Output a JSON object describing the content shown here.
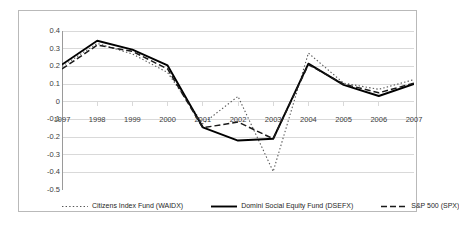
{
  "chart_data": {
    "type": "line",
    "title": "",
    "xlabel": "",
    "ylabel": "",
    "categories": [
      "1997",
      "1998",
      "1999",
      "2000",
      "2001",
      "2002",
      "2003",
      "2004",
      "2005",
      "2006",
      "2007"
    ],
    "ylim": [
      -0.5,
      0.4
    ],
    "ytick_labels": [
      "0.4",
      "0.3",
      "0.2",
      "0.1",
      "0",
      "-0.1",
      "-0.2",
      "-0.3",
      "-0.4",
      "-0.5"
    ],
    "ytick_values": [
      0.4,
      0.3,
      0.2,
      0.1,
      0,
      -0.1,
      -0.2,
      -0.3,
      -0.4,
      -0.5
    ],
    "grid": true,
    "legend_position": "bottom",
    "series": [
      {
        "name": "Citizens Index Fund (WAIDX)",
        "style": "dotted",
        "color": "#555555",
        "values": [
          0.2,
          0.33,
          0.27,
          0.165,
          -0.125,
          0.03,
          -0.395,
          0.275,
          0.105,
          0.07,
          0.125
        ]
      },
      {
        "name": "Domini Social Equity Fund (DSEFX)",
        "style": "solid",
        "color": "#000000",
        "values": [
          0.21,
          0.345,
          0.295,
          0.205,
          -0.145,
          -0.22,
          -0.21,
          0.215,
          0.095,
          0.032,
          0.1
        ]
      },
      {
        "name": "S&P 500 (SPX)",
        "style": "dashed",
        "color": "#1a1a1a",
        "values": [
          0.185,
          0.32,
          0.285,
          0.185,
          -0.148,
          -0.115,
          -0.21,
          0.21,
          0.1,
          0.05,
          0.105
        ]
      }
    ]
  },
  "colors": {
    "frame": "#b9b9b9",
    "axis": "#9a9a9a",
    "grid": "#d9d9d9",
    "text": "#3c3c3c",
    "background": "#ffffff"
  }
}
